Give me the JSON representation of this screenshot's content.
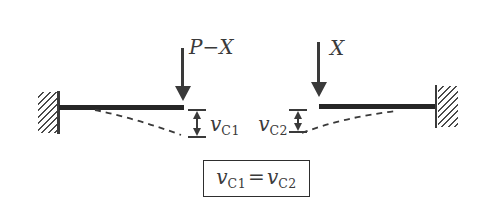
{
  "colors": {
    "bg": "#ffffff",
    "ink": "#3a3a3a",
    "beam": "#262626",
    "hatch": "#4a4a4a",
    "border": "#2e2e2e"
  },
  "left_system": {
    "load_label": "P−X",
    "deflection": {
      "base": "v",
      "sub": "C1"
    }
  },
  "right_system": {
    "load_label": "X",
    "deflection": {
      "base": "v",
      "sub": "C2"
    }
  },
  "equation": {
    "lhs": {
      "base": "v",
      "sub": "C1"
    },
    "relation": "=",
    "rhs": {
      "base": "v",
      "sub": "C2"
    }
  }
}
